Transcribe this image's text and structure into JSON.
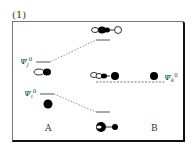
{
  "panel": {
    "label": "(1)"
  },
  "columns": {
    "left": "A",
    "right": "B"
  },
  "levels": {
    "psi_j": {
      "symbol": "Ψ",
      "sub": "j",
      "sup": "0"
    },
    "psi_i": {
      "symbol": "Ψ",
      "sub": "i",
      "sup": "0"
    },
    "psi_k": {
      "symbol": "Ψ",
      "sub": "k",
      "sup": "0"
    }
  },
  "colors": {
    "frame": "#111111",
    "line": "#555555",
    "lobe_filled": "#000000",
    "lobe_empty": "#ffffff"
  }
}
